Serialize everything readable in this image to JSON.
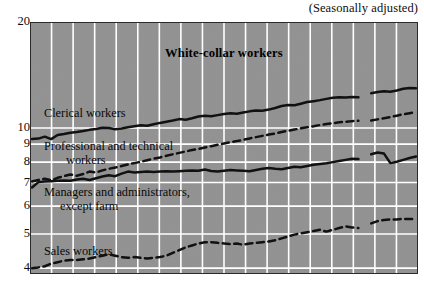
{
  "figure": {
    "note": "(Seasonally adjusted)",
    "title": "White-collar workers"
  },
  "chart_data": {
    "type": "line",
    "title": "White-collar workers",
    "subtitle": "(Seasonally adjusted)",
    "xlabel": "",
    "ylabel": "",
    "yscale": "log",
    "ylim": [
      3.85,
      20
    ],
    "yticks": [
      20,
      10,
      9,
      8,
      7,
      6,
      5,
      4
    ],
    "ytick_labels": [
      "20",
      "10",
      "9",
      "8",
      "7",
      "6",
      "5",
      "4"
    ],
    "grid": true,
    "grid_color": "#ffffff",
    "plot_background": "#8f8f8f",
    "legend": "inline-labels",
    "x": [
      0,
      1,
      2,
      3,
      4,
      5,
      6,
      7,
      8,
      9,
      10,
      11,
      12,
      13,
      14,
      15,
      16,
      17,
      18,
      19,
      20,
      21,
      22,
      23,
      24,
      25,
      26,
      27,
      28,
      29,
      30,
      31,
      32,
      33,
      34,
      35,
      36,
      37,
      38,
      39,
      40,
      41,
      42,
      43,
      44,
      45,
      46,
      47,
      48,
      49,
      50,
      51,
      52,
      53,
      54,
      55,
      56,
      57,
      58,
      59,
      60
    ],
    "series": [
      {
        "name": "Clerical workers",
        "style": "solid",
        "color": "#111111",
        "label_position": "upper-left",
        "values": [
          9.3,
          9.33,
          9.45,
          9.3,
          9.55,
          9.62,
          9.7,
          9.74,
          9.8,
          9.88,
          9.94,
          10.02,
          10.0,
          9.92,
          9.97,
          10.05,
          10.12,
          10.18,
          10.15,
          10.25,
          10.34,
          10.42,
          10.5,
          10.6,
          10.56,
          10.66,
          10.78,
          10.84,
          10.8,
          10.88,
          10.96,
          11.02,
          10.98,
          11.06,
          11.15,
          11.22,
          11.2,
          11.28,
          11.4,
          11.55,
          11.62,
          11.6,
          11.72,
          11.85,
          11.92,
          12.0,
          12.1,
          12.18,
          12.22,
          12.2,
          12.24,
          12.22,
          null,
          12.55,
          12.66,
          12.72,
          12.68,
          12.78,
          12.92,
          13.0,
          12.96
        ]
      },
      {
        "name": "Professional and technical workers",
        "style": "dashed",
        "color": "#111111",
        "label_position": "mid-left",
        "values": [
          7.05,
          7.12,
          7.18,
          7.1,
          7.22,
          7.3,
          7.38,
          7.32,
          7.4,
          7.52,
          7.48,
          7.58,
          7.66,
          7.72,
          7.8,
          7.88,
          7.95,
          8.02,
          8.1,
          8.18,
          8.25,
          8.34,
          8.42,
          8.5,
          8.58,
          8.66,
          8.72,
          8.8,
          8.88,
          8.96,
          9.04,
          9.12,
          9.18,
          9.26,
          9.34,
          9.42,
          9.5,
          9.58,
          9.65,
          9.74,
          9.82,
          9.9,
          9.98,
          10.05,
          10.12,
          10.2,
          10.26,
          10.32,
          10.38,
          10.42,
          10.46,
          10.48,
          null,
          10.5,
          10.58,
          10.66,
          10.74,
          10.84,
          10.94,
          11.02,
          11.1
        ]
      },
      {
        "name": "Managers and administrators, except farm",
        "style": "solid",
        "color": "#111111",
        "label_position": "lower-left",
        "values": [
          6.78,
          7.02,
          7.05,
          7.06,
          7.08,
          7.1,
          7.08,
          7.14,
          7.18,
          7.12,
          7.2,
          7.28,
          7.34,
          7.3,
          7.42,
          7.52,
          7.48,
          7.5,
          7.52,
          7.5,
          7.52,
          7.54,
          7.52,
          7.54,
          7.56,
          7.58,
          7.56,
          7.62,
          7.55,
          7.52,
          7.56,
          7.6,
          7.58,
          7.56,
          7.54,
          7.6,
          7.66,
          7.7,
          7.66,
          7.64,
          7.7,
          7.76,
          7.74,
          7.8,
          7.86,
          7.9,
          7.94,
          8.0,
          8.06,
          8.12,
          8.18,
          8.16,
          null,
          8.42,
          8.52,
          8.46,
          7.95,
          8.02,
          8.12,
          8.22,
          8.3
        ]
      },
      {
        "name": "Sales workers",
        "style": "dashed",
        "color": "#111111",
        "label_position": "bottom-left",
        "values": [
          4.0,
          4.02,
          4.05,
          4.12,
          4.16,
          4.2,
          4.22,
          4.22,
          4.24,
          4.26,
          4.3,
          4.34,
          4.38,
          4.34,
          4.3,
          4.28,
          4.3,
          4.28,
          4.26,
          4.28,
          4.3,
          4.34,
          4.42,
          4.5,
          4.58,
          4.64,
          4.7,
          4.74,
          4.74,
          4.72,
          4.7,
          4.68,
          4.7,
          4.66,
          4.7,
          4.72,
          4.74,
          4.76,
          4.8,
          4.86,
          4.92,
          4.98,
          5.02,
          5.06,
          5.1,
          5.14,
          5.08,
          5.14,
          5.2,
          5.26,
          5.22,
          5.2,
          null,
          5.36,
          5.44,
          5.48,
          5.5,
          5.5,
          5.52,
          5.52,
          5.5
        ]
      }
    ]
  },
  "axis": {
    "ticks": [
      {
        "label": "20",
        "value": 20
      },
      {
        "label": "10",
        "value": 10
      },
      {
        "label": "9",
        "value": 9
      },
      {
        "label": "8",
        "value": 8
      },
      {
        "label": "7",
        "value": 7
      },
      {
        "label": "6",
        "value": 6
      },
      {
        "label": "5",
        "value": 5
      },
      {
        "label": "4",
        "value": 4
      }
    ]
  },
  "labels": {
    "clerical": "Clerical workers",
    "professional_line1": "Professional and technical",
    "professional_line2": "workers",
    "managers_line1": "Managers and administrators,",
    "managers_line2": "except farm",
    "sales": "Sales workers"
  }
}
